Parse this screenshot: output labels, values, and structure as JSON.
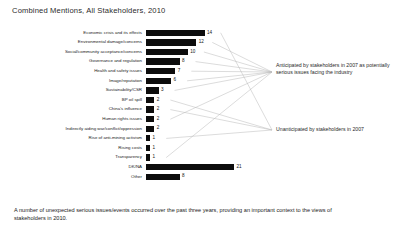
{
  "title": "Combined Mentions, All Stakeholders, 2010",
  "footnote": "A number of unexpected serious issues/events occurred over the past three years, providing an important context to the views of stakeholders in 2010.",
  "annotations": {
    "anticipated": "Anticipated by stakeholders in 2007 as potentially serious issues facing the industry",
    "unanticipated": "Unanticipated by stakeholders in 2007"
  },
  "chart_data": {
    "type": "bar",
    "orientation": "horizontal",
    "title": "Combined Mentions, All Stakeholders, 2010",
    "xlabel": "",
    "ylabel": "",
    "xlim": [
      0,
      21
    ],
    "grid": false,
    "legend": "none",
    "bar_color": "#0d0d0d",
    "categories": [
      "Economic crisis and its effects",
      "Environmental damage/concerns",
      "Social/community acceptance/concerns",
      "Governance and regulation",
      "Health and safety issues",
      "Image/reputation",
      "Sustainability/CSR",
      "BP oil spill",
      "China's influence",
      "Human rights issues",
      "Indirectly aiding war/conflict/oppression",
      "Rise of anti-mining activism",
      "Rising costs",
      "Transparency",
      "DK/NA",
      "Other"
    ],
    "values": [
      14,
      12,
      10,
      8,
      7,
      6,
      3,
      2,
      2,
      2,
      2,
      1,
      1,
      1,
      21,
      8
    ],
    "annotations": [
      {
        "text": "Anticipated by stakeholders in 2007 as potentially serious issues facing the industry",
        "applies_to": [
          "Environmental damage/concerns",
          "Social/community acceptance/concerns",
          "Governance and regulation",
          "Health and safety issues",
          "Image/reputation",
          "Sustainability/CSR",
          "Human rights issues",
          "Transparency"
        ]
      },
      {
        "text": "Unanticipated by stakeholders in 2007",
        "applies_to": [
          "Economic crisis and its effects",
          "BP oil spill",
          "China's influence",
          "Rise of anti-mining activism"
        ]
      }
    ]
  }
}
